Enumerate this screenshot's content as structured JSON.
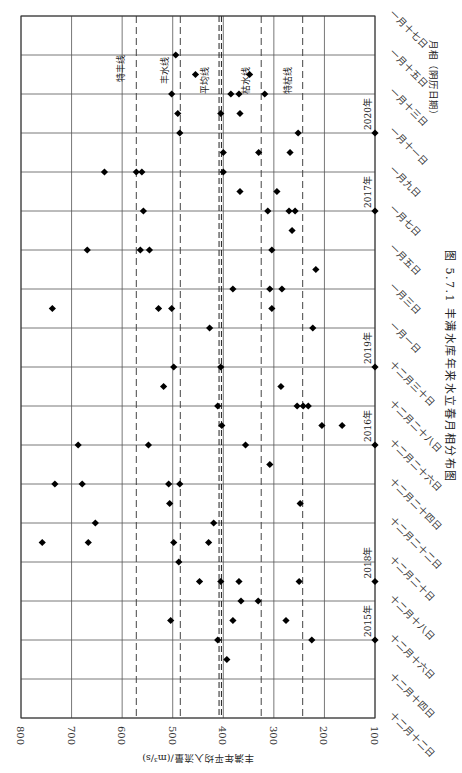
{
  "chart_data": {
    "type": "scatter",
    "orientation": "rotated-90",
    "title": "图 5.7.1   丰满水库年来水立春月相分布图",
    "ylabel": "丰满年平均入流量/(m³/s)",
    "xlabel": "月相（阴历日期）",
    "ylim": [
      100,
      800
    ],
    "y_ticks": [
      800,
      700,
      600,
      500,
      400,
      300,
      200,
      100
    ],
    "x_ticks": [
      "十二月十二日",
      "十二月十四日",
      "十二月十六日",
      "十二月十八日",
      "十二月二十日",
      "十二月二十二日",
      "十二月二十四日",
      "十二月二十六日",
      "十二月二十八日",
      "十二月三十日",
      "一月一日",
      "一月三日",
      "一月五日",
      "一月七日",
      "一月九日",
      "一月十一日",
      "一月十三日",
      "一月十五日",
      "一月十七日"
    ],
    "reference_lines": [
      {
        "name": "特丰线",
        "value": 572
      },
      {
        "name": "丰水线",
        "value": 485
      },
      {
        "name": "平均线",
        "value": 406
      },
      {
        "name": "枯水线",
        "value": 325
      },
      {
        "name": "特枯线",
        "value": 243
      }
    ],
    "year_markers": [
      {
        "label": "2015年",
        "pos": 2
      },
      {
        "label": "2018年",
        "pos": 3.5
      },
      {
        "label": "2016年",
        "pos": 7
      },
      {
        "label": "2019年",
        "pos": 9
      },
      {
        "label": "2017年",
        "pos": 13
      },
      {
        "label": "2020年",
        "pos": 15
      }
    ],
    "points": [
      {
        "pos": 1.5,
        "values": [
          393
        ]
      },
      {
        "pos": 2,
        "values": [
          411,
          225
        ]
      },
      {
        "pos": 2.5,
        "values": [
          504,
          381,
          276
        ]
      },
      {
        "pos": 3,
        "values": [
          365,
          331
        ]
      },
      {
        "pos": 3.5,
        "values": [
          447,
          405,
          369,
          250
        ]
      },
      {
        "pos": 4,
        "values": [
          488
        ]
      },
      {
        "pos": 4.5,
        "values": [
          758,
          667,
          498,
          429
        ]
      },
      {
        "pos": 5,
        "values": [
          653,
          419
        ]
      },
      {
        "pos": 5.5,
        "values": [
          506,
          248
        ]
      },
      {
        "pos": 6,
        "values": [
          733,
          679,
          508,
          486
        ]
      },
      {
        "pos": 6.5,
        "values": [
          308
        ]
      },
      {
        "pos": 7,
        "values": [
          687,
          548,
          356
        ]
      },
      {
        "pos": 7.5,
        "values": [
          403,
          205,
          165
        ]
      },
      {
        "pos": 8,
        "values": [
          411,
          254,
          242,
          232
        ]
      },
      {
        "pos": 8.5,
        "values": [
          518,
          286
        ]
      },
      {
        "pos": 9,
        "values": [
          498,
          405
        ]
      },
      {
        "pos": 10,
        "values": [
          427,
          223
        ]
      },
      {
        "pos": 10.5,
        "values": [
          738,
          528,
          502,
          304
        ]
      },
      {
        "pos": 11,
        "values": [
          381,
          308,
          284
        ]
      },
      {
        "pos": 11.5,
        "values": [
          217
        ]
      },
      {
        "pos": 12,
        "values": [
          669,
          564,
          546,
          304
        ]
      },
      {
        "pos": 12.5,
        "values": [
          264
        ]
      },
      {
        "pos": 13,
        "values": [
          558,
          312,
          270,
          258
        ]
      },
      {
        "pos": 13.5,
        "values": [
          367,
          294
        ]
      },
      {
        "pos": 14,
        "values": [
          635,
          572,
          561,
          400
        ]
      },
      {
        "pos": 14.5,
        "values": [
          400,
          330,
          268
        ]
      },
      {
        "pos": 15,
        "values": [
          486,
          252
        ]
      },
      {
        "pos": 15.5,
        "values": [
          490,
          405,
          367
        ]
      },
      {
        "pos": 16,
        "values": [
          502,
          385,
          369,
          318
        ]
      },
      {
        "pos": 16.5,
        "values": [
          455,
          348
        ]
      },
      {
        "pos": 17,
        "values": [
          494
        ]
      }
    ],
    "grid": true
  }
}
